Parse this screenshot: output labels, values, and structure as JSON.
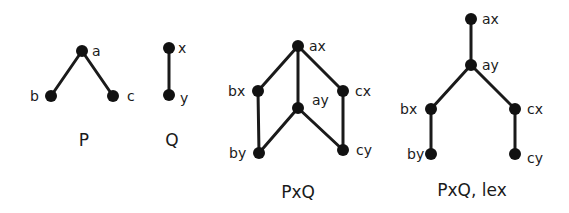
{
  "diagrams": [
    {
      "title": "P",
      "title_pos": [
        84,
        146
      ],
      "nodes": [
        {
          "id": "a",
          "label": "a",
          "x": 82,
          "y": 51,
          "lx": 92,
          "ly": 56
        },
        {
          "id": "b",
          "label": "b",
          "x": 51,
          "y": 96,
          "lx": 30,
          "ly": 101
        },
        {
          "id": "c",
          "label": "c",
          "x": 113,
          "y": 96,
          "lx": 127,
          "ly": 101
        }
      ],
      "edges": [
        [
          "a",
          "b"
        ],
        [
          "a",
          "c"
        ]
      ]
    },
    {
      "title": "Q",
      "title_pos": [
        172,
        146
      ],
      "nodes": [
        {
          "id": "x",
          "label": "x",
          "x": 169,
          "y": 48,
          "lx": 178,
          "ly": 53
        },
        {
          "id": "y",
          "label": "y",
          "x": 169,
          "y": 95,
          "lx": 180,
          "ly": 103
        }
      ],
      "edges": [
        [
          "x",
          "y"
        ]
      ]
    },
    {
      "title": "PxQ",
      "title_pos": [
        298,
        198
      ],
      "nodes": [
        {
          "id": "ax",
          "label": "ax",
          "x": 298,
          "y": 46,
          "lx": 309,
          "ly": 51
        },
        {
          "id": "bx",
          "label": "bx",
          "x": 258,
          "y": 91,
          "lx": 228,
          "ly": 96
        },
        {
          "id": "cx",
          "label": "cx",
          "x": 343,
          "y": 91,
          "lx": 355,
          "ly": 96
        },
        {
          "id": "ay",
          "label": "ay",
          "x": 298,
          "y": 108,
          "lx": 312,
          "ly": 105
        },
        {
          "id": "by",
          "label": "by",
          "x": 259,
          "y": 153,
          "lx": 229,
          "ly": 158
        },
        {
          "id": "cy",
          "label": "cy",
          "x": 343,
          "y": 150,
          "lx": 356,
          "ly": 155
        }
      ],
      "edges": [
        [
          "ax",
          "bx"
        ],
        [
          "ax",
          "ay"
        ],
        [
          "ax",
          "cx"
        ],
        [
          "bx",
          "by"
        ],
        [
          "ay",
          "by"
        ],
        [
          "ay",
          "cy"
        ],
        [
          "cx",
          "cy"
        ]
      ]
    },
    {
      "title": "PxQ, lex",
      "title_pos": [
        472,
        196
      ],
      "nodes": [
        {
          "id": "ax",
          "label": "ax",
          "x": 471,
          "y": 19,
          "lx": 482,
          "ly": 24
        },
        {
          "id": "ay",
          "label": "ay",
          "x": 471,
          "y": 65,
          "lx": 482,
          "ly": 70
        },
        {
          "id": "bx",
          "label": "bx",
          "x": 431,
          "y": 109,
          "lx": 400,
          "ly": 114
        },
        {
          "id": "cx",
          "label": "cx",
          "x": 515,
          "y": 109,
          "lx": 527,
          "ly": 114
        },
        {
          "id": "by",
          "label": "by",
          "x": 431,
          "y": 154,
          "lx": 407,
          "ly": 159
        },
        {
          "id": "cy",
          "label": "cy",
          "x": 515,
          "y": 154,
          "lx": 527,
          "ly": 163
        }
      ],
      "edges": [
        [
          "ax",
          "ay"
        ],
        [
          "ay",
          "bx"
        ],
        [
          "ay",
          "cx"
        ],
        [
          "bx",
          "by"
        ],
        [
          "cx",
          "cy"
        ]
      ]
    }
  ]
}
